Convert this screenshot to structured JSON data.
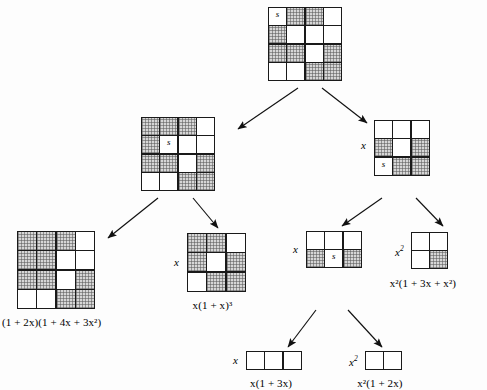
{
  "diagram": {
    "shade_color": "#d6d6d6",
    "line_color": "#1a1a1a",
    "nodes": [
      {
        "id": "root",
        "name": "root-grid",
        "cols": 4,
        "rows": 4,
        "cell": 17,
        "x": 268,
        "y": 7,
        "s_cell": [
          0,
          0
        ],
        "s_label": "s",
        "side_label": "",
        "caption": "",
        "shaded": [
          [
            false,
            true,
            true,
            false
          ],
          [
            true,
            false,
            false,
            false
          ],
          [
            true,
            true,
            false,
            true
          ],
          [
            false,
            false,
            true,
            true
          ]
        ]
      },
      {
        "id": "mid-left",
        "name": "mid-left-grid",
        "cols": 4,
        "rows": 4,
        "cell": 17,
        "x": 141,
        "y": 117,
        "s_cell": [
          1,
          1
        ],
        "s_label": "s",
        "side_label": "",
        "caption": "",
        "shaded": [
          [
            true,
            true,
            true,
            false
          ],
          [
            true,
            false,
            false,
            false
          ],
          [
            true,
            true,
            false,
            true
          ],
          [
            false,
            false,
            true,
            true
          ]
        ]
      },
      {
        "id": "mid-right",
        "name": "mid-right-grid",
        "cols": 3,
        "rows": 3,
        "cell": 17,
        "x": 374,
        "y": 120,
        "s_cell": [
          2,
          0
        ],
        "s_label": "s",
        "side_label": "x",
        "caption": "",
        "shaded": [
          [
            false,
            false,
            false
          ],
          [
            true,
            false,
            true
          ],
          [
            false,
            true,
            true
          ]
        ]
      },
      {
        "id": "bottom-left",
        "name": "bottom-left-grid",
        "cols": 4,
        "rows": 4,
        "cell": 18,
        "x": 17,
        "y": 231,
        "s_cell": null,
        "s_label": "",
        "side_label": "",
        "caption": "(1 + 2x)(1 + 4x + 3x²)",
        "shaded": [
          [
            true,
            true,
            true,
            false
          ],
          [
            true,
            true,
            false,
            false
          ],
          [
            true,
            true,
            false,
            true
          ],
          [
            false,
            false,
            true,
            true
          ]
        ]
      },
      {
        "id": "x-cubed",
        "name": "x-one-plus-x-cubed-grid",
        "cols": 3,
        "rows": 3,
        "cell": 18,
        "x": 187,
        "y": 233,
        "s_cell": null,
        "s_label": "",
        "side_label": "x",
        "caption": "x(1 + x)³",
        "shaded": [
          [
            true,
            true,
            false
          ],
          [
            true,
            false,
            true
          ],
          [
            false,
            true,
            true
          ]
        ]
      },
      {
        "id": "mid-bottom",
        "name": "x-three-by-two-grid",
        "cols": 3,
        "rows": 2,
        "cell": 17,
        "x": 306,
        "y": 231,
        "s_cell": [
          1,
          1
        ],
        "s_label": "s",
        "side_label": "x",
        "caption": "",
        "shaded": [
          [
            false,
            false,
            false
          ],
          [
            true,
            false,
            true
          ]
        ]
      },
      {
        "id": "x2-small",
        "name": "x-squared-two-by-two-grid",
        "cols": 2,
        "rows": 2,
        "cell": 17,
        "x": 411,
        "y": 232,
        "s_cell": null,
        "s_label": "",
        "side_label": "x²",
        "caption": "x²(1 + 3x + x²)",
        "shaded": [
          [
            false,
            false
          ],
          [
            false,
            true
          ]
        ]
      },
      {
        "id": "x-row",
        "name": "x-one-plus-3x-grid",
        "cols": 3,
        "rows": 1,
        "cell": 17,
        "x": 246,
        "y": 351,
        "s_cell": null,
        "s_label": "",
        "side_label": "x",
        "caption": "x(1 + 3x)",
        "shaded": [
          [
            false,
            false,
            false
          ]
        ]
      },
      {
        "id": "x2-row",
        "name": "x-squared-one-plus-2x-grid",
        "cols": 2,
        "rows": 1,
        "cell": 17,
        "x": 365,
        "y": 351,
        "s_cell": null,
        "s_label": "",
        "side_label": "x²",
        "caption": "x²(1 + 2x)",
        "shaded": [
          [
            false,
            false
          ]
        ]
      }
    ],
    "arrows": [
      {
        "name": "arrow-root-to-mid-left",
        "x1": 298,
        "y1": 88,
        "x2": 238,
        "y2": 129
      },
      {
        "name": "arrow-root-to-mid-right",
        "x1": 322,
        "y1": 88,
        "x2": 367,
        "y2": 123
      },
      {
        "name": "arrow-mid-left-to-bottom-left",
        "x1": 158,
        "y1": 198,
        "x2": 108,
        "y2": 238
      },
      {
        "name": "arrow-mid-left-to-x-cubed",
        "x1": 193,
        "y1": 198,
        "x2": 218,
        "y2": 228
      },
      {
        "name": "arrow-mid-right-to-mid-bottom",
        "x1": 382,
        "y1": 198,
        "x2": 342,
        "y2": 226
      },
      {
        "name": "arrow-mid-right-to-x2-small",
        "x1": 416,
        "y1": 198,
        "x2": 443,
        "y2": 226
      },
      {
        "name": "arrow-mid-bottom-to-x-row",
        "x1": 316,
        "y1": 310,
        "x2": 288,
        "y2": 347
      },
      {
        "name": "arrow-mid-bottom-to-x2-row",
        "x1": 348,
        "y1": 310,
        "x2": 382,
        "y2": 347
      }
    ]
  }
}
